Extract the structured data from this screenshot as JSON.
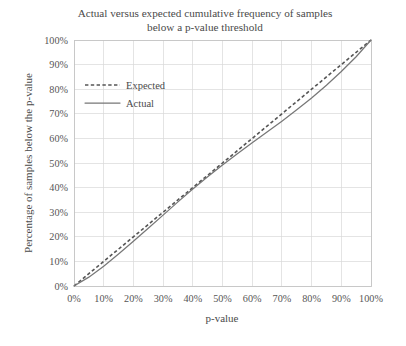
{
  "chart_data": {
    "type": "line",
    "title": "Actual versus expected cumulative frequency of samples below a p-value threshold",
    "title_line1": "Actual versus expected cumulative frequency of samples",
    "title_line2": "below a p-value threshold",
    "xlabel": "p-value",
    "ylabel": "Percentage of samples below the p-value",
    "xlim": [
      0,
      100
    ],
    "ylim": [
      0,
      100
    ],
    "grid": true,
    "legend_position": "upper-left-inside",
    "x_tick_labels": [
      "0%",
      "10%",
      "20%",
      "30%",
      "40%",
      "50%",
      "60%",
      "70%",
      "80%",
      "90%",
      "100%"
    ],
    "y_tick_labels": [
      "0%",
      "10%",
      "20%",
      "30%",
      "40%",
      "50%",
      "60%",
      "70%",
      "80%",
      "90%",
      "100%"
    ],
    "x_ticks": [
      0,
      10,
      20,
      30,
      40,
      50,
      60,
      70,
      80,
      90,
      100
    ],
    "y_ticks": [
      0,
      10,
      20,
      30,
      40,
      50,
      60,
      70,
      80,
      90,
      100
    ],
    "x": [
      0,
      5,
      10,
      15,
      20,
      25,
      30,
      35,
      40,
      45,
      50,
      55,
      60,
      65,
      70,
      75,
      80,
      85,
      90,
      95,
      100
    ],
    "series": [
      {
        "name": "Expected",
        "style": "dashed",
        "color": "#555555",
        "values": [
          0,
          5,
          10,
          15,
          20,
          25,
          30,
          35,
          40,
          45,
          50,
          55,
          60,
          65,
          70,
          75,
          80,
          85,
          90,
          95,
          100
        ]
      },
      {
        "name": "Actual",
        "style": "solid",
        "color": "#777777",
        "values": [
          0,
          3.6,
          8.0,
          13.0,
          18.2,
          23.5,
          28.8,
          34.2,
          39.4,
          44.4,
          49.2,
          53.8,
          58.2,
          62.6,
          67.0,
          71.6,
          76.4,
          81.6,
          87.2,
          93.2,
          100
        ]
      }
    ],
    "legend": [
      {
        "label": "Expected",
        "style": "dashed"
      },
      {
        "label": "Actual",
        "style": "solid"
      }
    ],
    "colors": {
      "expected": "#555555",
      "actual": "#777777",
      "grid": "#d8d8d8",
      "border": "#c0c0c0",
      "text": "#4a4a4a",
      "background": "#ffffff"
    }
  }
}
